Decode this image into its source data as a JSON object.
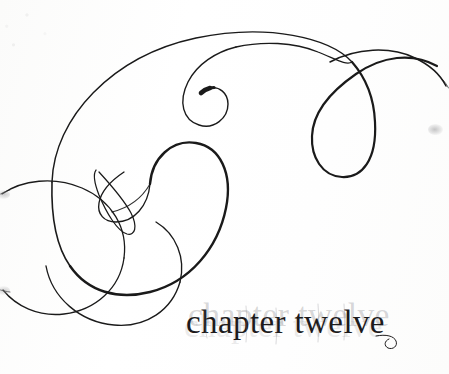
{
  "page": {
    "kind": "book-chapter-opener",
    "background_color": "#fdfdfc",
    "width": 449,
    "height": 374
  },
  "title": {
    "full_text": "chapter twelve",
    "word_chapter": "chapter",
    "word_number": "twelve",
    "ink_color": "#1d1b1c",
    "ghost_color": "#78787d"
  },
  "ornament": {
    "name": "calligraphic-flourish",
    "description": "large hand-drawn spiral flourish with interlocking loops",
    "stroke_color": "#1a1a1a",
    "stroke_color_light": "#2a2a2a"
  },
  "marks": {
    "edge_smudge_right": "scan-smudge",
    "edge_smudge_left_upper": "scan-smudge",
    "edge_smudge_left_lower": "scan-smudge"
  }
}
